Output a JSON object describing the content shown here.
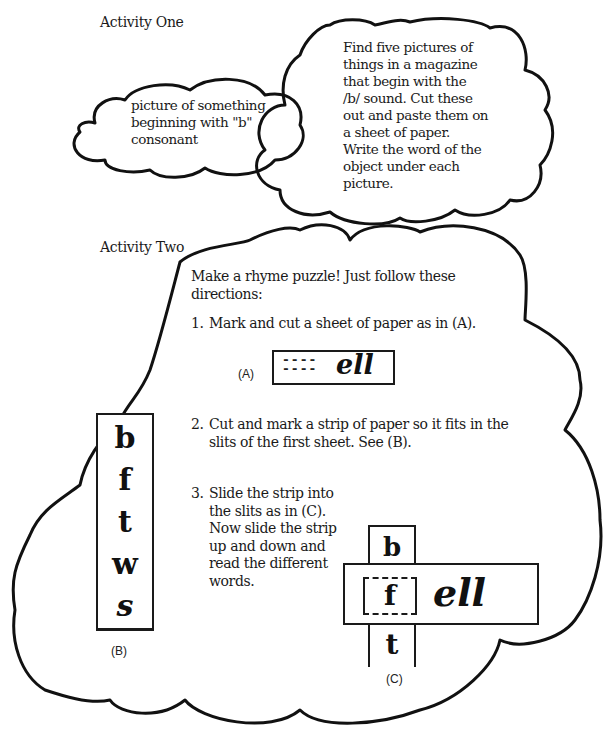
{
  "activity_one": {
    "heading": "Activity One",
    "small_cloud_text": [
      "picture of something",
      "beginning with \"b\"",
      "consonant"
    ],
    "large_cloud_text": [
      "Find five pictures of",
      "things in a magazine",
      "that begin with the",
      "/b/ sound. Cut these",
      "out and paste them on",
      "a sheet of paper.",
      "Write the word of the",
      "object under each",
      "picture."
    ]
  },
  "activity_two": {
    "heading": "Activity Two",
    "intro": [
      "Make a rhyme puzzle! Just follow these",
      "directions:"
    ],
    "steps": [
      {
        "num": "1.",
        "lines": [
          "Mark and cut a sheet of paper as in (A)."
        ]
      },
      {
        "num": "2.",
        "lines": [
          "Cut and mark a strip of paper so it fits in the",
          "slits of the first sheet. See (B)."
        ]
      },
      {
        "num": "3.",
        "lines": [
          "Slide the strip into",
          "the slits as in (C).",
          "Now slide the strip",
          "up and down and",
          "read the different",
          "words."
        ]
      }
    ],
    "figure_a": {
      "label": "(A)",
      "slits": "----",
      "slits2": "----",
      "ending": "ell"
    },
    "figure_b": {
      "label": "(B)",
      "letters": [
        "b",
        "f",
        "t",
        "w",
        "s"
      ]
    },
    "figure_c": {
      "label": "(C)",
      "top_letter": "b",
      "middle_letter": "f",
      "bottom_letter": "t",
      "ending": "ell"
    }
  },
  "colors": {
    "ink": "#1a1a1a",
    "paper": "#ffffff"
  }
}
